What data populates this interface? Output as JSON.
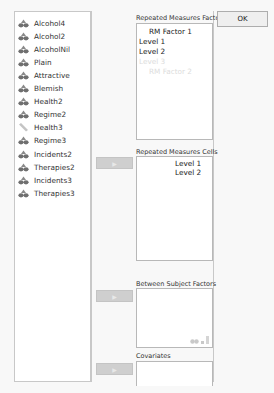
{
  "variables": [
    {
      "label": "Alcohol4",
      "icon": "scale-icon"
    },
    {
      "label": "Alcohol2",
      "icon": "scale-icon"
    },
    {
      "label": "AlcoholNil",
      "icon": "scale-icon"
    },
    {
      "label": "Plain",
      "icon": "scale-icon"
    },
    {
      "label": "Attractive",
      "icon": "scale-icon"
    },
    {
      "label": "Blemish",
      "icon": "scale-icon"
    },
    {
      "label": "Health2",
      "icon": "scale-icon"
    },
    {
      "label": "Regime2",
      "icon": "scale-icon"
    },
    {
      "label": "Health3",
      "icon": "ruler-icon"
    },
    {
      "label": "Regime3",
      "icon": "scale-icon"
    },
    {
      "label": "Incidents2",
      "icon": "scale-icon"
    },
    {
      "label": "Therapies2",
      "icon": "scale-icon"
    },
    {
      "label": "Incidents3",
      "icon": "scale-icon"
    },
    {
      "label": "Therapies3",
      "icon": "scale-icon"
    }
  ],
  "ok_label": "OK",
  "arrow_label": "▶",
  "sections": {
    "rm_factors": {
      "label": "Repeated Measures Factors",
      "items": [
        {
          "text": "RM Factor 1",
          "kind": "factor"
        },
        {
          "text": "Level 1",
          "kind": "level"
        },
        {
          "text": "Level 2",
          "kind": "level"
        },
        {
          "text": "Level 3",
          "kind": "placeholder-level"
        },
        {
          "text": "RM Factor 2",
          "kind": "placeholder-factor"
        }
      ]
    },
    "rm_cells": {
      "label": "Repeated Measures Cells",
      "items": [
        "Level 1",
        "Level 2"
      ]
    },
    "between": {
      "label": "Between Subject Factors",
      "allowed_types": [
        "nominal-icon",
        "ordinal-icon",
        "scale-icon"
      ]
    },
    "covariates": {
      "label": "Covariates"
    }
  },
  "colors": {
    "icon_gray": "#7a7a7a",
    "arrow_button": "#cfcfcf",
    "placeholder_text": "#dcdcdc"
  }
}
